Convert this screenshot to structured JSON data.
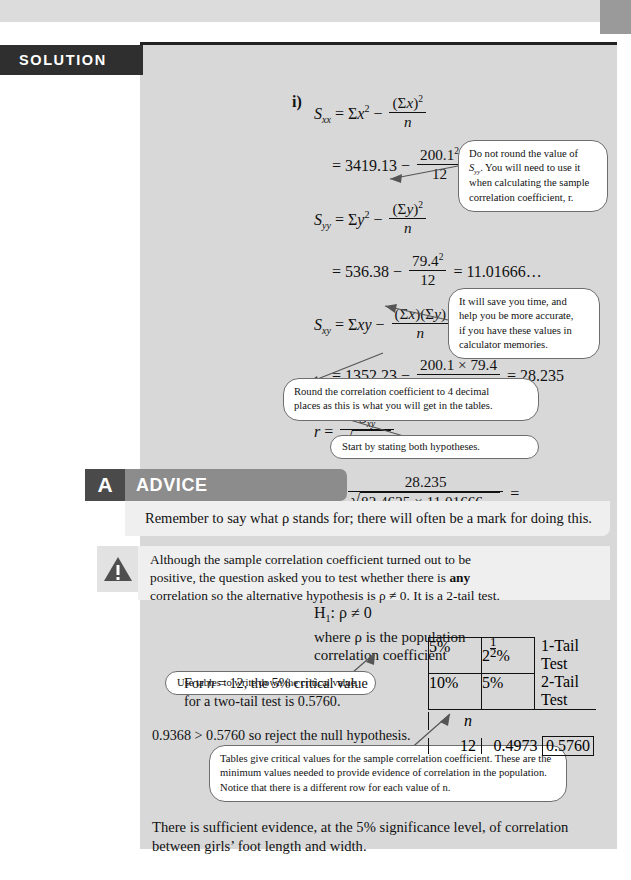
{
  "page": {
    "background_color": "#d8d8d8",
    "paper_color": "#ffffff"
  },
  "solution": {
    "banner_label": "SOLUTION",
    "banner_color": "#2f2f2f",
    "part_i_label": "i)",
    "part_ii_label": "ii)",
    "steps": {
      "sxx_def_lhs": "S",
      "sxx_sub": "xx",
      "sxx_sum": "x",
      "sxx_numeric_lhs": "3419.13",
      "sxx_numerator": "200.1",
      "sxx_denominator": "12",
      "sxx_result": "82.4625",
      "syy_sub": "yy",
      "syy_numeric_lhs": "536.38",
      "syy_numerator": "79.4",
      "syy_denominator": "12",
      "syy_result": "11.01666…",
      "sxy_sub": "xy",
      "sxy_numeric_lhs": "1352.23",
      "sxy_numerator": "200.1 × 79.4",
      "sxy_denominator": "12",
      "sxy_result": "28.235",
      "r_numerator": "28.235",
      "r_denominator": "82.4625 × 11.01666…",
      "r_value_long": "0.93677…",
      "r_value_rounded": "0.9368",
      "h0": "H",
      "h0_sub": "0",
      "h0_statement": ": ρ = 0",
      "h1_sub": "1",
      "h1_statement": ": ρ ≠ 0",
      "where_line1": "where ρ is the population",
      "where_line2": "correlation coefficient"
    }
  },
  "callouts": [
    {
      "id": "do-not-round",
      "line1": "Do not round the value of",
      "line2_pre": "S",
      "line2_sub": "yy",
      "line2_post": ". You will need to use it",
      "line3": "when calculating the sample",
      "line4": "correlation coefficient, r."
    },
    {
      "id": "calculator-memories",
      "line1": "It will save you time, and",
      "line2": "help you be more accurate,",
      "line3": "if you have these values in",
      "line4": "calculator memories."
    },
    {
      "id": "round-4dp",
      "line1": "Round the correlation coefficient to 4 decimal",
      "line2": "places as this is what you will get in the tables."
    },
    {
      "id": "state-hypotheses",
      "line1": "Start by stating both hypotheses."
    },
    {
      "id": "use-tables",
      "line1": "Use tables to write down the critical value."
    },
    {
      "id": "tables-explanation",
      "line1": "Tables give critical values for the sample correlation coefficient. These are the",
      "line2": "minimum values needed to provide evidence of correlation in the population.",
      "line3": "Notice that there is a different row for each value of n."
    }
  ],
  "advice": {
    "badge_letter": "A",
    "title": "ADVICE",
    "body": "Remember to say what ρ stands for; there will often be a mark for doing this.",
    "badge_color": "#4a4a4a",
    "bar_color": "#8c8c8c"
  },
  "warning": {
    "icon_name": "warning-triangle-icon",
    "line1": "Although the sample correlation coefficient turned out to be",
    "line2_pre": "positive, the question asked you to test whether there is ",
    "line2_bold": "any",
    "line3": "correlation so the alternative hypothesis is ρ ≠ 0. It is a 2-tail test."
  },
  "critical_value_section": {
    "intro_line1_pre": "For n = 12, the 5% critical value",
    "intro_line2": "for a two-tail test is 0.5760.",
    "conclusion_inequality": "0.9368 > 0.5760 so reject the null hypothesis."
  },
  "table": {
    "headers_row1": [
      "5%",
      "2½%"
    ],
    "headers_row1_label": "1-Tail Test",
    "headers_row2": [
      "10%",
      "5%"
    ],
    "headers_row2_label": "2-Tail Test",
    "n_label": "n",
    "data_row": {
      "n": "12",
      "values": [
        "0.4973",
        "0.5760"
      ],
      "highlighted_index": 1
    }
  },
  "conclusion": {
    "line1": "There is sufficient evidence, at the 5% significance level, of correlation",
    "line2": "between girls’ foot length and width."
  }
}
